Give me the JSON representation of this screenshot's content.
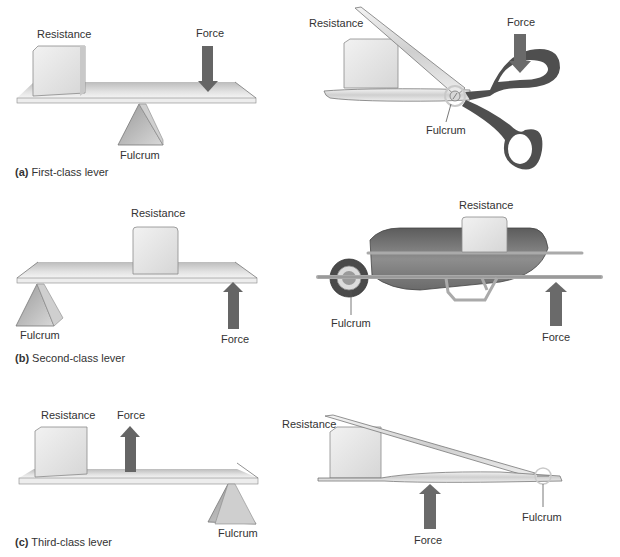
{
  "figure": {
    "panels": [
      {
        "id": "a",
        "letter": "(a)",
        "caption": "First-class lever",
        "lever_labels": {
          "resistance": "Resistance",
          "force": "Force",
          "fulcrum": "Fulcrum"
        },
        "example": "scissors",
        "example_labels": {
          "resistance": "Resistance",
          "force": "Force",
          "fulcrum": "Fulcrum"
        }
      },
      {
        "id": "b",
        "letter": "(b)",
        "caption": "Second-class lever",
        "lever_labels": {
          "resistance": "Resistance",
          "force": "Force",
          "fulcrum": "Fulcrum"
        },
        "example": "wheelbarrow",
        "example_labels": {
          "resistance": "Resistance",
          "force": "Force",
          "fulcrum": "Fulcrum"
        }
      },
      {
        "id": "c",
        "letter": "(c)",
        "caption": "Third-class lever",
        "lever_labels": {
          "resistance": "Resistance",
          "force": "Force",
          "fulcrum": "Fulcrum"
        },
        "example": "tweezers",
        "example_labels": {
          "resistance": "Resistance",
          "force": "Force",
          "fulcrum": "Fulcrum"
        }
      }
    ],
    "colors": {
      "beam": "#d9d9d9",
      "block": "#e6e6e6",
      "arrow": "#6b6b6b",
      "fulcrum": "#bdbdbd",
      "handle": "#555555",
      "barrow": "#7a7a7a"
    }
  }
}
